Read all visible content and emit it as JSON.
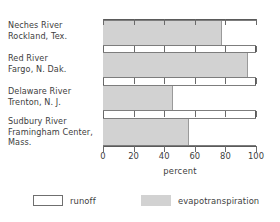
{
  "chart_data": {
    "type": "bar",
    "orientation": "horizontal",
    "stacked": true,
    "title": "",
    "xlabel": "percent",
    "ylabel": "",
    "xlim": [
      0,
      100
    ],
    "xticks": [
      0,
      20,
      40,
      60,
      80,
      100
    ],
    "xtick_labels": [
      "0",
      "20",
      "40",
      "60",
      "80",
      "100"
    ],
    "grid": false,
    "legend_position": "bottom-left",
    "categories": [
      "Neches River Rockland, Tex.",
      "Red River Fargo, N. Dak.",
      "Delaware River Trenton, N. J.",
      "Sudbury River Framingham Center, Mass."
    ],
    "category_label_lines": [
      [
        "Neches River",
        "Rockland, Tex."
      ],
      [
        "Red River",
        "Fargo, N. Dak."
      ],
      [
        "Delaware River",
        "Trenton, N. J."
      ],
      [
        "Sudbury River",
        "Framingham Center,",
        "Mass."
      ]
    ],
    "series": [
      {
        "name": "evapotranspiration",
        "color": "#d2d2d2",
        "values": [
          78,
          95,
          46,
          56
        ]
      },
      {
        "name": "runoff",
        "color": "#ffffff",
        "values": [
          22,
          5,
          54,
          44
        ]
      }
    ]
  },
  "legend": {
    "items": [
      {
        "label": "runoff",
        "swatch": "runoff"
      },
      {
        "label": "evapotranspiration",
        "swatch": "evap"
      }
    ]
  },
  "axis": {
    "x_title": "percent",
    "tick_0": "0",
    "tick_1": "20",
    "tick_2": "40",
    "tick_3": "60",
    "tick_4": "80",
    "tick_5": "100"
  },
  "colors": {
    "evapotranspiration_fill": "#d2d2d2",
    "runoff_fill": "#ffffff",
    "axis_line": "#5a5a5a",
    "text": "#3d3d3d",
    "background": "#ffffff"
  }
}
